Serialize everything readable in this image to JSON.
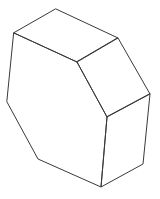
{
  "diagram": {
    "type": "3d-wireframe-solid",
    "description": "Isometric line drawing of a hexagonal-prism-like solid (chamfered box)",
    "style": {
      "background": "#ffffff",
      "stroke": "#3a3a3a",
      "stroke_width": 1
    },
    "vertices": {
      "top": [
        56,
        9
      ],
      "left_top": [
        14,
        33
      ],
      "right_top": [
        118,
        38
      ],
      "inner": [
        77,
        62
      ],
      "right": [
        150,
        94
      ],
      "left": [
        7,
        102
      ],
      "front_inner": [
        107,
        117
      ],
      "lower_left": [
        38,
        159
      ],
      "right_bottom": [
        143,
        164
      ],
      "bottom": [
        101,
        187
      ]
    },
    "faces": [
      {
        "name": "top-face",
        "points": [
          "top",
          "right_top",
          "inner",
          "left_top"
        ]
      },
      {
        "name": "upper-right-face",
        "points": [
          "right_top",
          "right",
          "front_inner",
          "inner"
        ]
      },
      {
        "name": "right-face",
        "points": [
          "right",
          "right_bottom",
          "bottom",
          "front_inner"
        ]
      },
      {
        "name": "front-face",
        "points": [
          "left_top",
          "inner",
          "front_inner",
          "bottom",
          "lower_left",
          "left"
        ]
      }
    ]
  }
}
